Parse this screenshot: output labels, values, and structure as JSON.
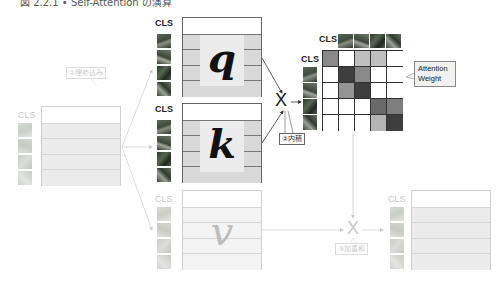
{
  "title": "図 2.2.1 • Self-Attention の演算",
  "labels": {
    "cls": "CLS",
    "q": "q",
    "k": "k",
    "v": "v",
    "multiply": "X",
    "attention_weight_line1": "Attention",
    "attention_weight_line2": "Weight"
  },
  "steps": {
    "embed": "①埋め込み",
    "dot_product": "②内積",
    "weighted_sum": "③加重和"
  },
  "attention_matrix": {
    "rows": 5,
    "cols": 5,
    "weights": [
      [
        0.55,
        0.0,
        0.3,
        0.3,
        0.0
      ],
      [
        0.0,
        0.9,
        0.55,
        0.0,
        0.0
      ],
      [
        0.0,
        0.5,
        0.9,
        0.0,
        0.0
      ],
      [
        0.0,
        0.0,
        0.0,
        0.7,
        0.6
      ],
      [
        0.0,
        0.0,
        0.0,
        0.35,
        0.9
      ]
    ]
  },
  "colors": {
    "line": "#555555",
    "faded_line": "#d0d0d0"
  }
}
